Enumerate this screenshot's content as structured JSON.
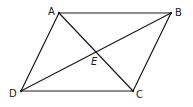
{
  "diagram": {
    "title": "",
    "shape": "parallelogram",
    "colors": {
      "stroke": "#1a1a1a",
      "label": "#222222",
      "background": "#ffffff"
    },
    "points": {
      "A": {
        "label": "A",
        "x": 59,
        "y": 13,
        "lx": 48,
        "ly": 15
      },
      "B": {
        "label": "B",
        "x": 171,
        "y": 13,
        "lx": 175,
        "ly": 16
      },
      "C": {
        "label": "C",
        "x": 133,
        "y": 91,
        "lx": 136,
        "ly": 98
      },
      "D": {
        "label": "D",
        "x": 21,
        "y": 91,
        "lx": 9,
        "ly": 97
      },
      "E": {
        "label": "E",
        "x": 96,
        "y": 52,
        "lx": 91,
        "ly": 65
      }
    },
    "segments": [
      {
        "name": "AB",
        "from": "A",
        "to": "B"
      },
      {
        "name": "BC",
        "from": "B",
        "to": "C"
      },
      {
        "name": "CD",
        "from": "C",
        "to": "D"
      },
      {
        "name": "DA",
        "from": "D",
        "to": "A"
      },
      {
        "name": "AC",
        "from": "A",
        "to": "C"
      },
      {
        "name": "BD",
        "from": "B",
        "to": "D"
      }
    ]
  }
}
